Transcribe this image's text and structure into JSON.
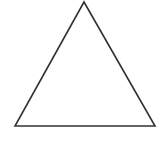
{
  "figure": {
    "shape": "triangle",
    "type": "equilateral-like triangle outline",
    "vertices": {
      "apex": [
        84,
        2
      ],
      "bottom_left": [
        15,
        126
      ],
      "bottom_right": [
        155,
        126
      ]
    },
    "stroke_color": "#333333",
    "fill_color": "#ffffff",
    "stroke_width": 1.6
  },
  "caption": {
    "text": "",
    "note": "cropped, illegible text fragment at bottom edge"
  },
  "colors": {
    "background": "#ffffff",
    "line": "#333333"
  }
}
